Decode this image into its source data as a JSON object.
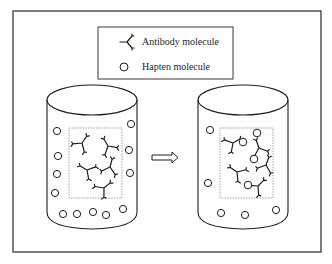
{
  "diagram": {
    "type": "illustration",
    "colors": {
      "ink": "#1e1e1e",
      "frame": "#3a3a3a",
      "dashed_region": "#8a8a8a",
      "background": "#ffffff"
    },
    "legend": {
      "items": [
        {
          "icon": "antibody-y-icon",
          "label": "Antibody molecule"
        },
        {
          "icon": "hapten-circle-icon",
          "label": "Hapten molecule"
        }
      ]
    },
    "panels": [
      {
        "name": "before",
        "description": "Container with antibodies confined in dashed central region; haptens free outside",
        "antibody_count": 5,
        "hapten_count": 12,
        "bound_pairs": 0
      },
      {
        "name": "after",
        "description": "Haptens diffused into central region and bound to antibodies",
        "antibody_count": 5,
        "hapten_count": 9,
        "bound_pairs": 4
      }
    ],
    "transition_icon": "hollow-right-arrow-icon"
  }
}
